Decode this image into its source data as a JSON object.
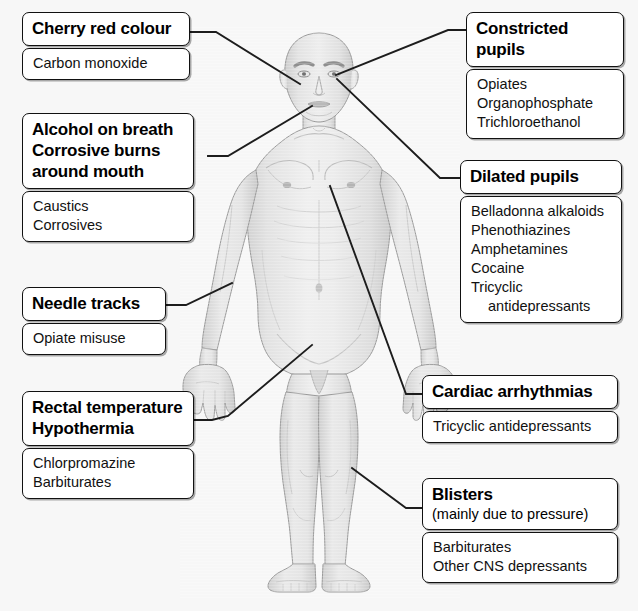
{
  "figure": {
    "background_color": "#f7f7f7",
    "line_color": "#1a1a1a",
    "box_fill": "#ffffff",
    "box_border": "#111111"
  },
  "callouts": [
    {
      "id": "cherry-red-colour",
      "heading": "Cherry red colour",
      "subheading": "",
      "causes": [
        "Carbon monoxide"
      ],
      "anchor": "face"
    },
    {
      "id": "constricted-pupils",
      "heading": "Constricted pupils",
      "subheading": "",
      "causes": [
        "Opiates",
        "Organophosphate",
        "Trichloroethanol"
      ],
      "anchor": "right-eye"
    },
    {
      "id": "alcohol-on-breath",
      "heading": "Alcohol on breath\nCorrosive burns\naround mouth",
      "subheading": "",
      "causes": [
        "Caustics",
        "Corrosives"
      ],
      "anchor": "mouth"
    },
    {
      "id": "dilated-pupils",
      "heading": "Dilated pupils",
      "subheading": "",
      "causes": [
        "Belladonna alkaloids",
        "Phenothiazines",
        "Amphetamines",
        "Cocaine",
        "Tricyclic",
        "antidepressants"
      ],
      "anchor": "left-eye"
    },
    {
      "id": "needle-tracks",
      "heading": "Needle tracks",
      "subheading": "",
      "causes": [
        "Opiate misuse"
      ],
      "anchor": "right-hand"
    },
    {
      "id": "cardiac-arrhythmias",
      "heading": "Cardiac arrhythmias",
      "subheading": "",
      "causes": [
        "Tricyclic antidepressants"
      ],
      "anchor": "chest"
    },
    {
      "id": "rectal-temperature",
      "heading": "Rectal temperature\nHypothermia",
      "subheading": "",
      "causes": [
        "Chlorpromazine",
        "Barbiturates"
      ],
      "anchor": "groin"
    },
    {
      "id": "blisters",
      "heading": "Blisters",
      "subheading": "(mainly due to pressure)",
      "causes": [
        "Barbiturates",
        "Other CNS depressants"
      ],
      "anchor": "left-shin"
    }
  ]
}
